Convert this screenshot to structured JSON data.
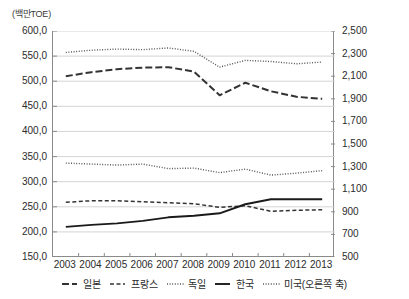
{
  "chart_data": {
    "type": "line",
    "title": "",
    "subtitle": "",
    "unit_caption": "(백만TOE)",
    "xlabel": "",
    "ylabel_left": "(백만TOE)",
    "ylabel_right": "",
    "grid": true,
    "legend_position": "bottom",
    "x": [
      "2003",
      "2004",
      "2005",
      "2006",
      "2007",
      "2008",
      "2009",
      "2010",
      "2011",
      "2012",
      "2013"
    ],
    "ylim_left": [
      150.0,
      600.0
    ],
    "yticks_left": [
      "150,0",
      "200,0",
      "250,0",
      "300,0",
      "350,0",
      "400,0",
      "450,0",
      "500,0",
      "550,0",
      "600,0"
    ],
    "ylim_right": [
      500,
      2500
    ],
    "yticks_right": [
      "500",
      "700",
      "900",
      "1,100",
      "1,300",
      "1,500",
      "1,700",
      "1,900",
      "2,100",
      "2,300",
      "2,500"
    ],
    "series": [
      {
        "name": "일본",
        "axis": "left",
        "style": "dashed",
        "color": "#333333",
        "values": [
          510,
          518,
          524,
          527,
          528,
          519,
          472,
          497,
          480,
          469,
          465
        ]
      },
      {
        "name": "프랑스",
        "axis": "left",
        "style": "dashed-short",
        "color": "#333333",
        "values": [
          259,
          262,
          262,
          260,
          258,
          256,
          249,
          252,
          241,
          243,
          244
        ]
      },
      {
        "name": "독일",
        "axis": "left",
        "style": "dotted",
        "color": "#555555",
        "values": [
          337,
          335,
          333,
          335,
          326,
          327,
          318,
          325,
          313,
          317,
          322
        ]
      },
      {
        "name": "한국",
        "axis": "left",
        "style": "solid",
        "color": "#1a1a1a",
        "values": [
          210,
          214,
          217,
          222,
          229,
          232,
          237,
          255,
          265,
          265,
          265
        ]
      },
      {
        "name": "미국(오른쪽 축)",
        "axis": "right",
        "style": "dotted",
        "color": "#555555",
        "values": [
          2310,
          2330,
          2340,
          2335,
          2350,
          2320,
          2180,
          2240,
          2230,
          2210,
          2225
        ]
      }
    ]
  },
  "legend": {
    "items": [
      {
        "label": "일본",
        "style": "dashed"
      },
      {
        "label": "프랑스",
        "style": "dashed-short"
      },
      {
        "label": "독일",
        "style": "dotted"
      },
      {
        "label": "한국",
        "style": "solid"
      },
      {
        "label": "미국(오른쪽 축)",
        "style": "dotted"
      }
    ]
  }
}
